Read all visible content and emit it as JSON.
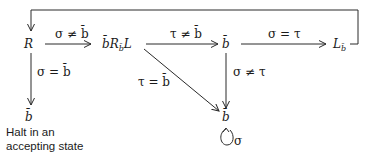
{
  "diagram": {
    "type": "turing-machine-state-diagram",
    "nodes": {
      "R": {
        "main": "R"
      },
      "bRbL": {
        "pre": "b̄",
        "main": "R",
        "sub": "b̄",
        "post": "L"
      },
      "b_mid": {
        "main": "b̄"
      },
      "Lb": {
        "main": "L",
        "sub": "b̄"
      },
      "b_halt": {
        "main": "b̄"
      },
      "b_loop": {
        "main": "b̄"
      }
    },
    "edges": {
      "R_to_bRbL": "σ ≠ b̄",
      "bRbL_to_bmid": "τ ≠ b̄",
      "bmid_to_Lb": "σ = τ",
      "R_to_halt": "σ = b̄",
      "bRbL_to_bloop": "τ = b̄",
      "bmid_to_bloop": "σ ≠ τ",
      "self_loop": "σ"
    },
    "halt_note": {
      "line1": "Halt in an",
      "line2": "accepting state"
    }
  }
}
